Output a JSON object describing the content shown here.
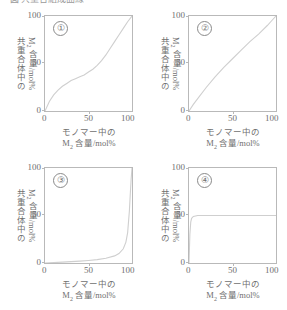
{
  "top_clipped_text": "図 共重合組成曲線",
  "axis": {
    "y_title_line1": "共重合体中の",
    "y_title_line2_pre": "M",
    "y_title_line2_sub": "2",
    "y_title_line2_post": " 含量/mol%",
    "x_title_line1": "モノマー中の",
    "x_title_line2_pre": "M",
    "x_title_line2_sub": "2",
    "x_title_line2_post": " 含量/mol%",
    "ticks": [
      "0",
      "50",
      "100"
    ]
  },
  "panels": [
    {
      "index": "①"
    },
    {
      "index": "②"
    },
    {
      "index": "③"
    },
    {
      "index": "④"
    }
  ],
  "colors": {
    "curve": "#cfcfcf",
    "frame": "#b9b9b9",
    "text": "#6f6f6f"
  },
  "chart_data": [
    {
      "type": "line",
      "title": "①",
      "xlabel": "モノマー中の M2 含量/mol%",
      "ylabel": "共重合体中の M2 含量/mol%",
      "xlim": [
        0,
        100
      ],
      "ylim": [
        0,
        100
      ],
      "xticks": [
        0,
        50,
        100
      ],
      "yticks": [
        0,
        50,
        100
      ],
      "grid": false,
      "legend": "none",
      "annotation": "S-shaped (sigmoid) copolymer composition curve; crosses the diagonal, r1>1 and r2>1",
      "x": [
        0,
        5,
        10,
        15,
        20,
        25,
        30,
        35,
        40,
        45,
        50,
        55,
        60,
        65,
        70,
        75,
        80,
        85,
        90,
        95,
        100
      ],
      "y": [
        0,
        10,
        17,
        22,
        26,
        29,
        32,
        34,
        36,
        38,
        41,
        44,
        48,
        53,
        59,
        66,
        73,
        80,
        87,
        94,
        100
      ]
    },
    {
      "type": "line",
      "title": "②",
      "xlabel": "モノマー中の M2 含量/mol%",
      "ylabel": "共重合体中の M2 含量/mol%",
      "xlim": [
        0,
        100
      ],
      "ylim": [
        0,
        100
      ],
      "xticks": [
        0,
        50,
        100
      ],
      "yticks": [
        0,
        50,
        100
      ],
      "grid": false,
      "legend": "none",
      "annotation": "Gently convex curve lying slightly above the diagonal; ideal copolymerization r1<1, r2<1",
      "x": [
        0,
        5,
        10,
        20,
        30,
        40,
        50,
        60,
        70,
        80,
        90,
        95,
        100
      ],
      "y": [
        0,
        7,
        13,
        25,
        36,
        46,
        55,
        64,
        73,
        81,
        90,
        95,
        100
      ]
    },
    {
      "type": "line",
      "title": "③",
      "xlabel": "モノマー中の M2 含量/mol%",
      "ylabel": "共重合体中の M2 含量/mol%",
      "xlim": [
        0,
        100
      ],
      "ylim": [
        0,
        100
      ],
      "xticks": [
        0,
        50,
        100
      ],
      "yticks": [
        0,
        50,
        100
      ],
      "grid": false,
      "legend": "none",
      "annotation": "Stays near zero until about 85 mol%, then rises almost vertically to 100 near x=98",
      "x": [
        0,
        10,
        20,
        30,
        40,
        50,
        60,
        70,
        80,
        85,
        90,
        93,
        95,
        97,
        98,
        99,
        100
      ],
      "y": [
        0,
        0.4,
        0.9,
        1.4,
        2,
        2.7,
        3.6,
        5,
        7.5,
        10,
        15,
        22,
        32,
        55,
        72,
        88,
        100
      ]
    },
    {
      "type": "line",
      "title": "④",
      "xlabel": "モノマー中の M2 含量/mol%",
      "ylabel": "共重合体中の M2 含量/mol%",
      "xlim": [
        0,
        100
      ],
      "ylim": [
        0,
        100
      ],
      "xticks": [
        0,
        50,
        100
      ],
      "yticks": [
        0,
        50,
        100
      ],
      "grid": false,
      "legend": "none",
      "annotation": "Rises steeply from 0 at x=0 to about 50, then remains a flat horizontal line at 50 mol% (alternating copolymer)",
      "x": [
        0,
        1,
        2,
        3,
        5,
        10,
        20,
        30,
        40,
        50,
        60,
        70,
        80,
        90,
        100
      ],
      "y": [
        0,
        30,
        43,
        47,
        49,
        50,
        50,
        50,
        50,
        50,
        50,
        50,
        50,
        50,
        50
      ]
    }
  ]
}
